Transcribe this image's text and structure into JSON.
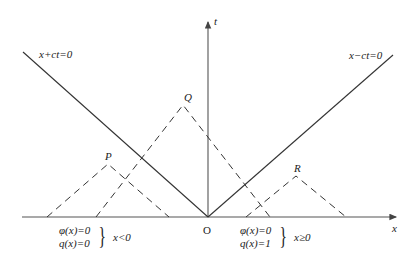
{
  "diagram": {
    "type": "spacetime light-cone diagram",
    "axes": {
      "x_label": "x",
      "t_label": "t",
      "origin_label": "O"
    },
    "lines": {
      "left_light_line": "x+ct=0",
      "right_light_line": "x−ct=0"
    },
    "points": [
      {
        "label": "P"
      },
      {
        "label": "Q"
      },
      {
        "label": "R"
      }
    ],
    "initial_conditions": {
      "left": {
        "phi": "φ(x)=0",
        "q": "q(x)=0",
        "domain": "x<0"
      },
      "right": {
        "phi": "φ(x)=0",
        "q": "q(x)=1",
        "domain": "x≥0"
      }
    },
    "colors": {
      "line": "#333333",
      "axis": "#555555",
      "text": "#222222"
    }
  }
}
